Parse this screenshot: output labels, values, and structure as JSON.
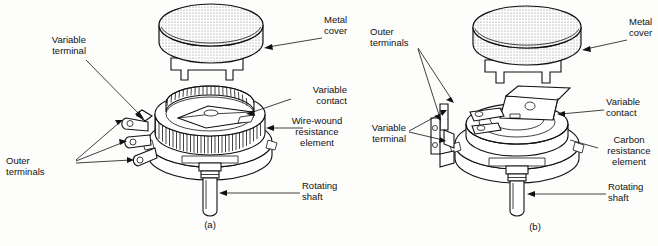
{
  "figure": {
    "panels": [
      {
        "id": "a",
        "caption": "(a)",
        "type": "wire-wound potentiometer",
        "labels": [
          {
            "name": "variable-terminal",
            "text": "Variable\nterminal",
            "align": "right"
          },
          {
            "name": "outer-terminals",
            "text": "Outer\nterminals",
            "align": "left"
          },
          {
            "name": "metal-cover",
            "text": "Metal\ncover",
            "align": "left"
          },
          {
            "name": "variable-contact",
            "text": "Variable\ncontact",
            "align": "right"
          },
          {
            "name": "wire-wound-resistance-element",
            "text": "Wire-wound\nresistance\nelement",
            "align": "center"
          },
          {
            "name": "rotating-shaft",
            "text": "Rotating\nshaft",
            "align": "left"
          }
        ]
      },
      {
        "id": "b",
        "caption": "(b)",
        "type": "carbon potentiometer",
        "labels": [
          {
            "name": "outer-terminals",
            "text": "Outer\nterminals",
            "align": "left"
          },
          {
            "name": "variable-terminal",
            "text": "Variable\nterminal",
            "align": "right"
          },
          {
            "name": "metal-cover",
            "text": "Metal\ncover",
            "align": "left"
          },
          {
            "name": "variable-contact",
            "text": "Variable\ncontact",
            "align": "left"
          },
          {
            "name": "carbon-resistance-element",
            "text": "Carbon\nresistance\nelement",
            "align": "center"
          },
          {
            "name": "rotating-shaft",
            "text": "Rotating\nshaft",
            "align": "left"
          }
        ]
      }
    ],
    "colors": {
      "line": "#111111",
      "background": "#fdfdfc",
      "cover_fill": "#e8e8e8"
    }
  }
}
